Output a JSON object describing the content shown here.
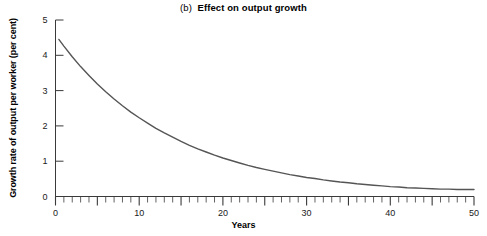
{
  "chart_data": {
    "type": "line",
    "title_tag": "(b)",
    "title_main": "Effect on output growth",
    "xlabel": "Years",
    "ylabel": "Growth rate of output per worker (per cent)",
    "xlim": [
      0,
      50
    ],
    "ylim": [
      0,
      5
    ],
    "grid": false,
    "legend": "none",
    "x_ticks_major": [
      0,
      5,
      10,
      15,
      20,
      25,
      30,
      35,
      40,
      45,
      50
    ],
    "x_tick_interval_minor": 1,
    "x_tick_labels": [
      "0",
      "10",
      "20",
      "30",
      "40",
      "50"
    ],
    "x_tick_label_values": [
      0,
      10,
      20,
      30,
      40,
      50
    ],
    "y_ticks": [
      0,
      1,
      2,
      3,
      4,
      5
    ],
    "y_tick_labels": [
      "0",
      "1",
      "2",
      "3",
      "4",
      "5"
    ],
    "series": [
      {
        "name": "Growth rate of output per worker",
        "color": "#555555",
        "x": [
          0.4,
          1,
          2,
          3,
          4,
          5,
          6,
          7,
          8,
          9,
          10,
          11,
          12,
          13,
          14,
          15,
          16,
          17,
          18,
          19,
          20,
          21,
          22,
          23,
          24,
          25,
          26,
          27,
          28,
          29,
          30,
          31,
          32,
          33,
          34,
          35,
          36,
          37,
          38,
          39,
          40,
          41,
          42,
          43,
          44,
          45,
          46,
          47,
          48,
          49,
          50
        ],
        "values": [
          4.45,
          4.26,
          3.96,
          3.68,
          3.43,
          3.19,
          2.97,
          2.76,
          2.57,
          2.39,
          2.23,
          2.08,
          1.93,
          1.8,
          1.68,
          1.56,
          1.45,
          1.35,
          1.26,
          1.17,
          1.09,
          1.02,
          0.95,
          0.88,
          0.82,
          0.77,
          0.72,
          0.67,
          0.62,
          0.58,
          0.54,
          0.51,
          0.47,
          0.44,
          0.41,
          0.39,
          0.36,
          0.34,
          0.32,
          0.3,
          0.28,
          0.27,
          0.25,
          0.24,
          0.23,
          0.22,
          0.21,
          0.21,
          0.2,
          0.2,
          0.2
        ]
      }
    ]
  },
  "colors": {
    "axis": "#3a3a3a",
    "curve": "#555555",
    "text": "#000000",
    "background": "#ffffff"
  }
}
